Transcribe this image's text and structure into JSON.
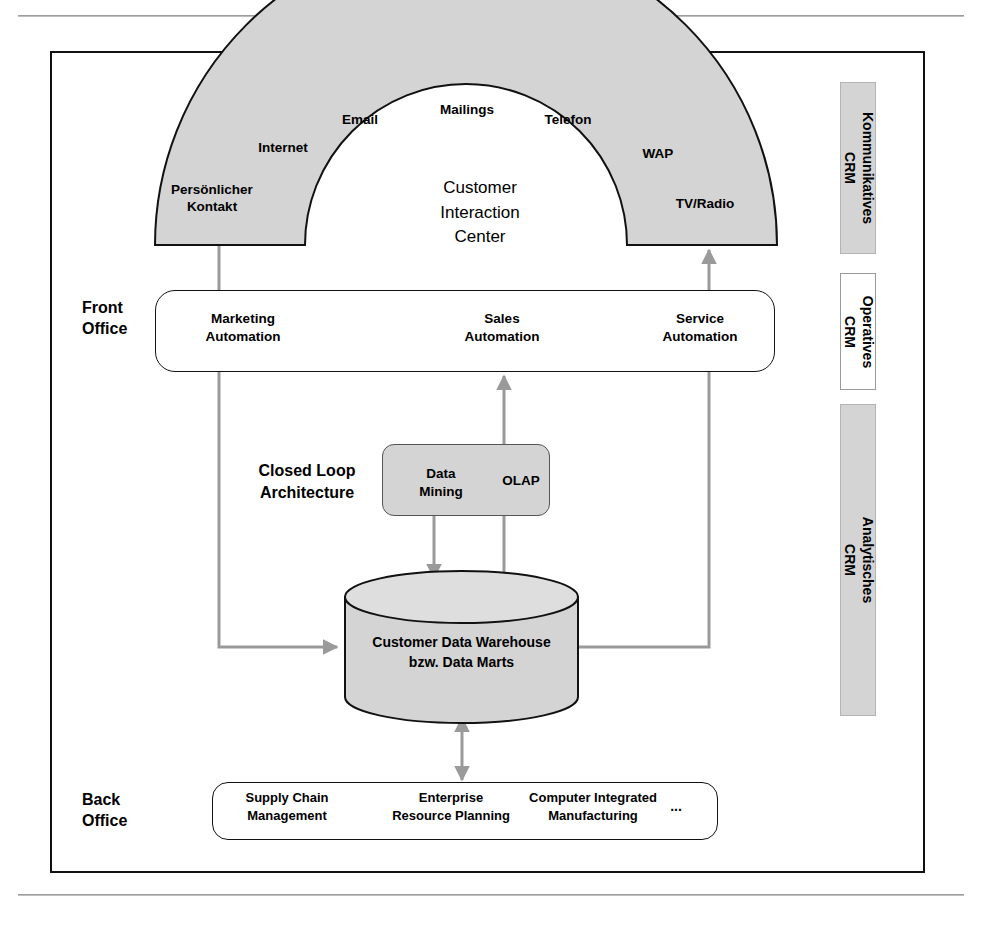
{
  "page": {
    "cut_heading": "",
    "frame": {
      "border_color": "#111111"
    }
  },
  "diagram": {
    "arch": {
      "center_label": "Customer\nInteraction\nCenter",
      "fill_color": "#d4d4d4",
      "stroke_color": "#111111",
      "channels": [
        {
          "label": "Persönlicher\nKontakt"
        },
        {
          "label": "Internet"
        },
        {
          "label": "Email"
        },
        {
          "label": "Mailings"
        },
        {
          "label": "Telefon"
        },
        {
          "label": "WAP"
        },
        {
          "label": "TV/Radio"
        }
      ]
    },
    "front_office": {
      "side_label": "Front\nOffice",
      "items": [
        {
          "label": "Marketing\nAutomation"
        },
        {
          "label": "Sales\nAutomation"
        },
        {
          "label": "Service\nAutomation"
        }
      ]
    },
    "closed_loop": {
      "label": "Closed Loop\nArchitecture",
      "items": [
        {
          "label": "Data\nMining"
        },
        {
          "label": "OLAP"
        }
      ],
      "fill_color": "#d4d4d4"
    },
    "data_warehouse": {
      "label": "Customer Data Warehouse\nbzw. Data Marts",
      "fill_color": "#d4d4d4",
      "stroke_color": "#111111"
    },
    "back_office": {
      "side_label": "Back\nOffice",
      "items": [
        {
          "label": "Supply Chain\nManagement"
        },
        {
          "label": "Enterprise\nResource Planning"
        },
        {
          "label": "Computer Integrated\nManufacturing"
        },
        {
          "label": "..."
        }
      ]
    },
    "crm_column": [
      {
        "line1": "Kommunikatives",
        "line2": "CRM",
        "fill": "#d4d4d4"
      },
      {
        "line1": "Operatives",
        "line2": "CRM",
        "fill": "#ffffff"
      },
      {
        "line1": "Analytisches",
        "line2": "CRM",
        "fill": "#d4d4d4"
      }
    ],
    "connector_color": "#9a9a9a"
  }
}
